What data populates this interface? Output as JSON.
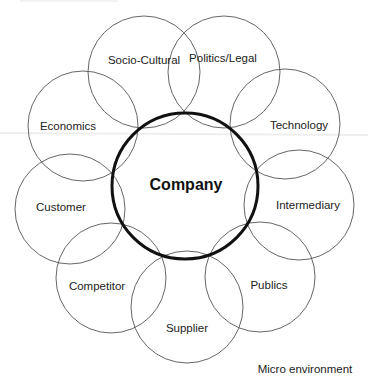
{
  "diagram": {
    "center": {
      "label": "Company",
      "cx": 185,
      "cy": 186,
      "r": 73
    },
    "nodes": [
      {
        "id": "socio-cultural",
        "label": "Socio-Cultural",
        "cx": 144,
        "cy": 72,
        "r": 56,
        "lx": 144,
        "ly": 61
      },
      {
        "id": "politics-legal",
        "label": "Politics/Legal",
        "cx": 224,
        "cy": 72,
        "r": 56,
        "lx": 223,
        "ly": 59
      },
      {
        "id": "technology",
        "label": "Technology",
        "cx": 285,
        "cy": 124,
        "r": 55,
        "lx": 299,
        "ly": 126
      },
      {
        "id": "intermediary",
        "label": "Intermediary",
        "cx": 299,
        "cy": 205,
        "r": 55,
        "lx": 308,
        "ly": 206
      },
      {
        "id": "publics",
        "label": "Publics",
        "cx": 260,
        "cy": 277,
        "r": 55,
        "lx": 269,
        "ly": 286
      },
      {
        "id": "supplier",
        "label": "Supplier",
        "cx": 187,
        "cy": 307,
        "r": 56,
        "lx": 187,
        "ly": 329
      },
      {
        "id": "competitor",
        "label": "Competitor",
        "cx": 111,
        "cy": 278,
        "r": 55,
        "lx": 97,
        "ly": 287
      },
      {
        "id": "customer",
        "label": "Customer",
        "cx": 70,
        "cy": 209,
        "r": 55,
        "lx": 61,
        "ly": 208
      },
      {
        "id": "economics",
        "label": "Economics",
        "cx": 83,
        "cy": 126,
        "r": 55,
        "lx": 68,
        "ly": 127
      }
    ],
    "caption": "Micro environment"
  }
}
